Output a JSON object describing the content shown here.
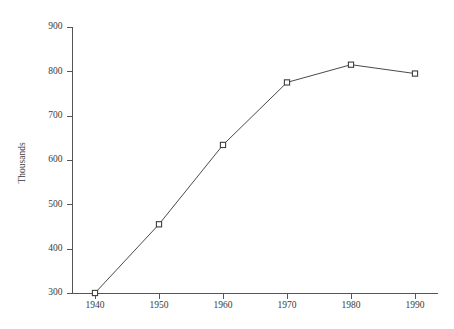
{
  "chart_data": {
    "type": "line",
    "title": "",
    "subtitle": "",
    "xlabel": "",
    "ylabel": "Thousands",
    "x": [
      1940,
      1950,
      1960,
      1970,
      1980,
      1990
    ],
    "categories": [
      "1940",
      "1950",
      "1960",
      "1970",
      "1980",
      "1990"
    ],
    "values": [
      300,
      455,
      634,
      775,
      815,
      795
    ],
    "series": [
      {
        "name": "Thousands",
        "values": [
          300,
          455,
          634,
          775,
          815,
          795
        ]
      }
    ],
    "xlim": [
      1937,
      1995
    ],
    "ylim": [
      300,
      900
    ],
    "ytick_labels": [
      "900",
      "800",
      "700",
      "600",
      "500",
      "400",
      "300"
    ],
    "ytick_values": [
      900,
      800,
      700,
      600,
      500,
      400,
      300
    ],
    "xtick_labels": [
      "1940",
      "1950",
      "1960",
      "1970",
      "1980",
      "1990"
    ],
    "xtick_values": [
      1940,
      1950,
      1960,
      1970,
      1980,
      1990
    ],
    "grid": false,
    "legend": "none",
    "marker": "open-square",
    "line_color": "#4a4a4a",
    "marker_color": "#3d3d3d",
    "axis_color": "#555555",
    "background_color": "#ffffff",
    "annotations": []
  },
  "axis": {
    "y_title": "Thousands",
    "ticks_y": [
      {
        "label": "900",
        "value": 900
      },
      {
        "label": "800",
        "value": 800
      },
      {
        "label": "700",
        "value": 700
      },
      {
        "label": "600",
        "value": 600
      },
      {
        "label": "500",
        "value": 500
      },
      {
        "label": "400",
        "value": 400
      },
      {
        "label": "300",
        "value": 300
      }
    ],
    "ticks_x": [
      {
        "label": "1940",
        "value": 1940
      },
      {
        "label": "1950",
        "value": 1950
      },
      {
        "label": "1960",
        "value": 1960
      },
      {
        "label": "1970",
        "value": 1970
      },
      {
        "label": "1980",
        "value": 1980
      },
      {
        "label": "1990",
        "value": 1990
      }
    ]
  }
}
